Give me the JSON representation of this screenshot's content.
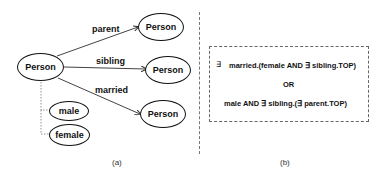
{
  "panel_a": {
    "root": "Person",
    "edges": [
      {
        "label": "parent",
        "target": "Person"
      },
      {
        "label": "sibling",
        "target": "Person"
      },
      {
        "label": "married",
        "target": "Person"
      }
    ],
    "attributes": [
      "male",
      "female"
    ],
    "caption": "(a)"
  },
  "panel_b": {
    "line1_symbol": "∃",
    "line1": "married.(female AND ∃ sibling.TOP)",
    "line2": "OR",
    "line3": "male AND ∃ sibling.(∃ parent.TOP)",
    "caption": "(b)"
  }
}
